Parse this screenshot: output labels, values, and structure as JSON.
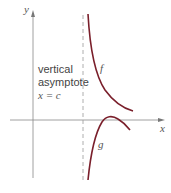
{
  "figure": {
    "axes": {
      "x_label": "x",
      "y_label": "y"
    },
    "asymptote": {
      "label_line1": "vertical",
      "label_line2": "asymptote",
      "equation": "x = c"
    },
    "curves": [
      {
        "name": "f",
        "label": "f",
        "color": "#7a1f2b"
      },
      {
        "name": "g",
        "label": "g",
        "color": "#7a1f2b"
      }
    ],
    "colors": {
      "axis": "#888888",
      "asymptote": "#999999",
      "curve": "#7a1f2b"
    }
  }
}
